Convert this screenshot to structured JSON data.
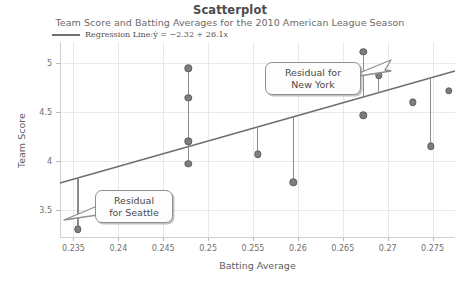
{
  "chart_data": {
    "type": "scatter",
    "title": "Scatterplot",
    "subtitle": "Team Score and Batting Averages for the 2010 American League Season",
    "xlabel": "Batting Average",
    "ylabel": "Team Score",
    "xlim": [
      0.2335,
      0.2775
    ],
    "ylim": [
      3.22,
      5.22
    ],
    "xticks": [
      "0.235",
      "0.24",
      "0.245",
      "0.25",
      "0.255",
      "0.26",
      "0.265",
      "0.27",
      "0.275"
    ],
    "xtick_values": [
      0.235,
      0.24,
      0.245,
      0.25,
      0.255,
      0.26,
      0.265,
      0.27,
      0.275
    ],
    "yticks": [
      "3.5",
      "4",
      "4.5",
      "5"
    ],
    "ytick_values": [
      3.5,
      4.0,
      4.5,
      5.0
    ],
    "grid": true,
    "legend_position": "top-left",
    "series": [
      {
        "name": "Team observations",
        "marker": "filled-circle",
        "color": "#7d7d7d",
        "points": [
          {
            "x": 0.2355,
            "y": 3.3,
            "label": "Seattle"
          },
          {
            "x": 0.2478,
            "y": 4.95
          },
          {
            "x": 0.2478,
            "y": 4.65
          },
          {
            "x": 0.2478,
            "y": 4.2
          },
          {
            "x": 0.2478,
            "y": 3.97
          },
          {
            "x": 0.2555,
            "y": 4.07
          },
          {
            "x": 0.2595,
            "y": 3.78
          },
          {
            "x": 0.2673,
            "y": 5.12,
            "label": "New York"
          },
          {
            "x": 0.2673,
            "y": 4.47
          },
          {
            "x": 0.269,
            "y": 4.88
          },
          {
            "x": 0.2728,
            "y": 4.6
          },
          {
            "x": 0.2748,
            "y": 4.15
          },
          {
            "x": 0.2768,
            "y": 4.72
          }
        ]
      }
    ],
    "regression": {
      "legend_text": "Regression Line:",
      "equation_yhat": "ŷ",
      "equation_rest": " = −2.32 + 26.1",
      "equation_x": "x",
      "intercept": -2.32,
      "slope": 26.1,
      "color": "#6f6f6f"
    },
    "residual_segments": [
      {
        "x": 0.2355,
        "y_point": 3.3,
        "y_line": 3.827
      },
      {
        "x": 0.2478,
        "y_point": 4.95,
        "y_line": 4.147
      },
      {
        "x": 0.2478,
        "y_point": 4.65,
        "y_line": 4.147
      },
      {
        "x": 0.2478,
        "y_point": 3.97,
        "y_line": 4.147
      },
      {
        "x": 0.2555,
        "y_point": 4.07,
        "y_line": 4.348
      },
      {
        "x": 0.2595,
        "y_point": 3.78,
        "y_line": 4.452
      },
      {
        "x": 0.2673,
        "y_point": 5.12,
        "y_line": 4.656
      },
      {
        "x": 0.269,
        "y_point": 4.88,
        "y_line": 4.7
      },
      {
        "x": 0.2748,
        "y_point": 4.15,
        "y_line": 4.852
      }
    ],
    "annotations": [
      {
        "name": "new-york",
        "text": "Residual for\nNew York",
        "tail": "right"
      },
      {
        "name": "seattle",
        "text": "Residual\nfor Seattle",
        "tail": "left"
      }
    ]
  }
}
